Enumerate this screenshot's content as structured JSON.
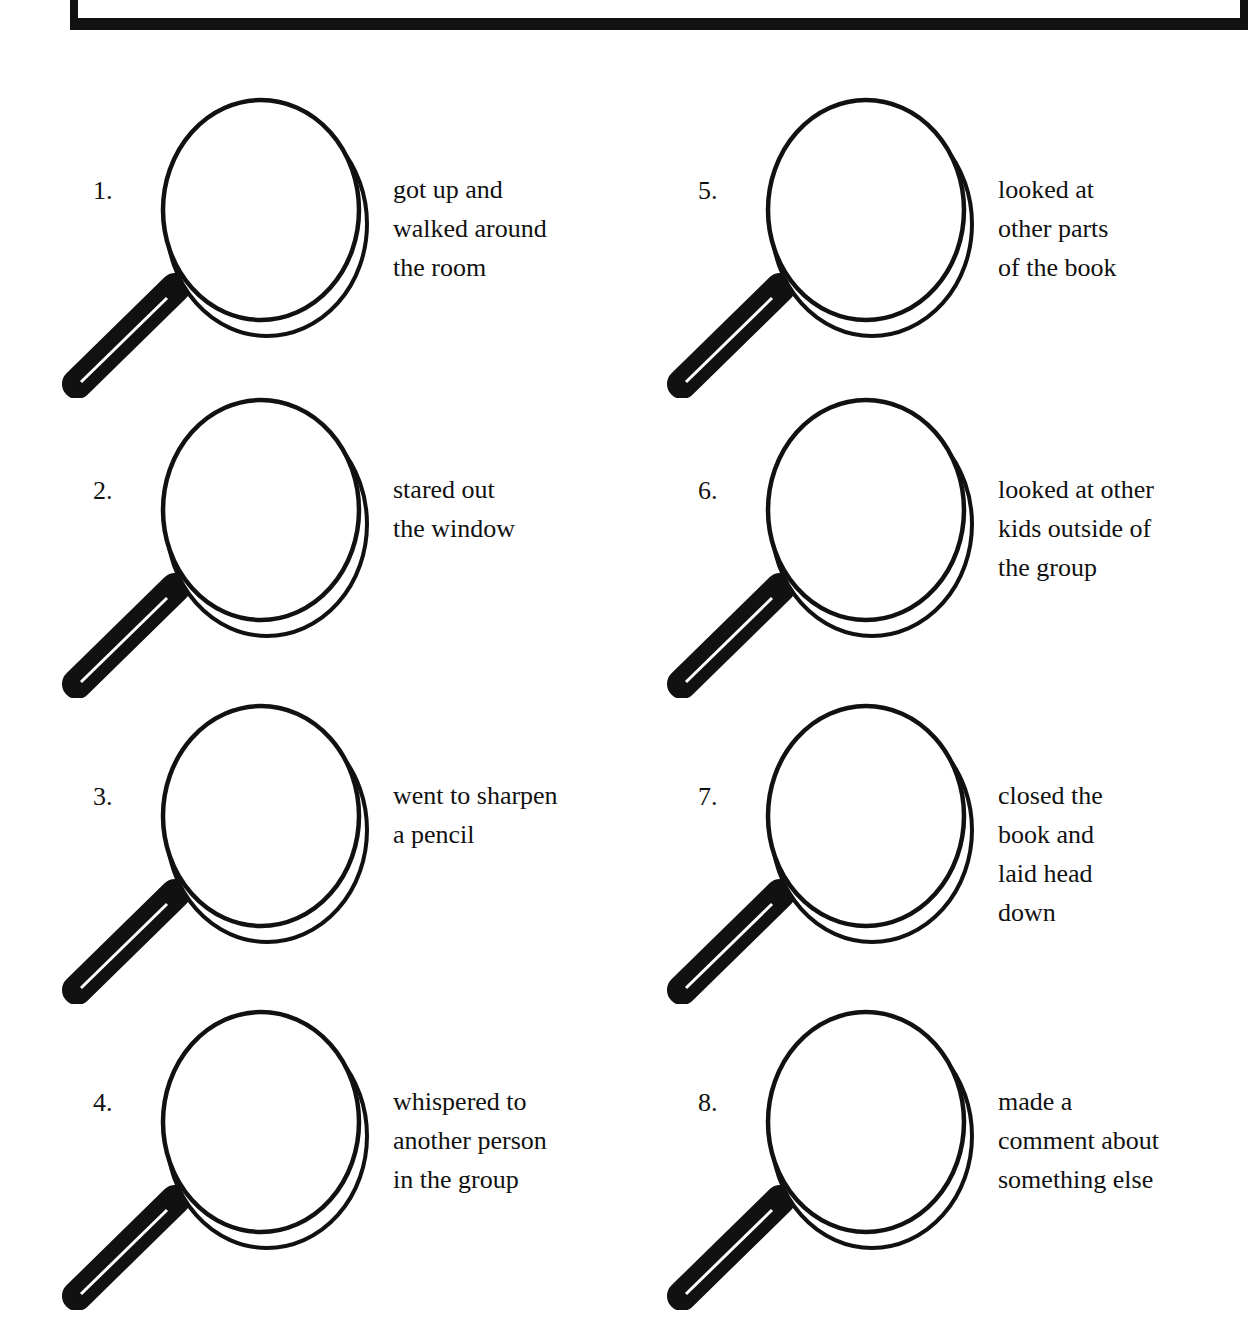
{
  "worksheet": {
    "items": [
      {
        "number": "1.",
        "lines": [
          "got up and",
          "walked around",
          "the room"
        ]
      },
      {
        "number": "2.",
        "lines": [
          "stared out",
          "the window"
        ]
      },
      {
        "number": "3.",
        "lines": [
          "went to sharpen",
          "a pencil"
        ]
      },
      {
        "number": "4.",
        "lines": [
          "whispered to",
          "another person",
          "in the group"
        ]
      },
      {
        "number": "5.",
        "lines": [
          "looked at",
          "other parts",
          "of the book"
        ]
      },
      {
        "number": "6.",
        "lines": [
          "looked at other",
          "kids outside of",
          "the group"
        ]
      },
      {
        "number": "7.",
        "lines": [
          "closed the",
          "book and",
          "laid head",
          "down"
        ]
      },
      {
        "number": "8.",
        "lines": [
          "made a",
          "comment about",
          "something else"
        ]
      }
    ],
    "icon": "magnifying-glass-icon",
    "ink_color": "#111111",
    "paper_color": "#ffffff"
  }
}
